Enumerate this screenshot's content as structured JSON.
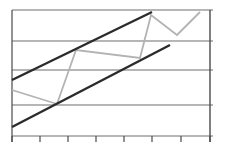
{
  "chart_data": {
    "type": "line",
    "title": "",
    "xlabel": "",
    "ylabel": "",
    "grid": true,
    "legend": null,
    "x_ticks": 8,
    "y_gridlines": 5,
    "series": [
      {
        "name": "price",
        "color": "#b3b3b3",
        "points": [
          [
            12,
            90
          ],
          [
            57,
            104
          ],
          [
            76,
            50
          ],
          [
            140,
            58
          ],
          [
            151,
            15
          ],
          [
            177,
            35
          ],
          [
            200,
            12
          ]
        ]
      },
      {
        "name": "upper-trendline",
        "color": "#2b2b2b",
        "points": [
          [
            12,
            80
          ],
          [
            152,
            12
          ]
        ]
      },
      {
        "name": "lower-trendline",
        "color": "#2b2b2b",
        "points": [
          [
            12,
            127
          ],
          [
            170,
            45
          ]
        ]
      }
    ],
    "layout": {
      "plot_left": 12,
      "plot_right": 210,
      "plot_top": 10,
      "plot_bottom": 136,
      "gridlines_y": [
        10,
        41,
        70,
        105,
        136
      ],
      "ticks_x": [
        12,
        40,
        68,
        96,
        124,
        152,
        181,
        210
      ]
    },
    "colors": {
      "grid": "#6e6e6e",
      "axis": "#4a4a4a",
      "price": "#b3b3b3",
      "trend": "#2b2b2b"
    }
  }
}
